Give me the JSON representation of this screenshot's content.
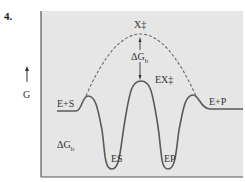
{
  "figure": {
    "number": "4.",
    "type": "energy-diagram",
    "y_axis_label": "G",
    "colors": {
      "panel_background": "#e6e6e6",
      "frame": "#555555",
      "curve": "#5a5a5a",
      "dashed_curve": "#6a6a6a"
    },
    "labels": {
      "transition_state_uncatalyzed": "X‡",
      "transition_state_catalyzed": "EX‡",
      "delta_g_top": "ΔG",
      "delta_g_top_sub": "b",
      "delta_g_left": "ΔG",
      "delta_g_left_sub": "b",
      "reactants": "E+S",
      "products": "E+P",
      "es_complex": "ES",
      "ep_complex": "EP"
    }
  }
}
